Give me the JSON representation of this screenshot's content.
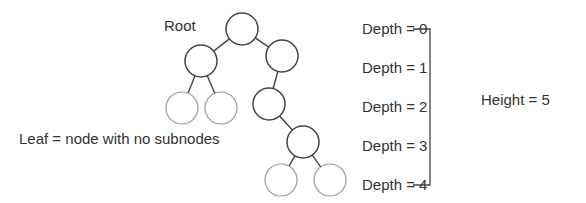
{
  "labels": {
    "root": "Root",
    "leaf": "Leaf = node with no subnodes",
    "height": "Height = 5"
  },
  "depths": [
    {
      "label": "Depth = 0",
      "y": 20
    },
    {
      "label": "Depth = 1",
      "y": 59
    },
    {
      "label": "Depth = 2",
      "y": 98
    },
    {
      "label": "Depth = 3",
      "y": 137
    },
    {
      "label": "Depth = 4",
      "y": 176
    }
  ],
  "tree": {
    "nodes": [
      {
        "id": "root",
        "cx": 242,
        "cy": 29,
        "leaf": false
      },
      {
        "id": "n1",
        "cx": 201,
        "cy": 61,
        "leaf": false
      },
      {
        "id": "n2",
        "cx": 282,
        "cy": 56,
        "leaf": false
      },
      {
        "id": "n3",
        "cx": 182,
        "cy": 108,
        "leaf": true
      },
      {
        "id": "n4",
        "cx": 221,
        "cy": 108,
        "leaf": true
      },
      {
        "id": "n5",
        "cx": 269,
        "cy": 104,
        "leaf": false
      },
      {
        "id": "n6",
        "cx": 303,
        "cy": 142,
        "leaf": false
      },
      {
        "id": "n7",
        "cx": 281,
        "cy": 180,
        "leaf": true
      },
      {
        "id": "n8",
        "cx": 330,
        "cy": 180,
        "leaf": true
      }
    ],
    "edges": [
      [
        "root",
        "n1"
      ],
      [
        "root",
        "n2"
      ],
      [
        "n1",
        "n3"
      ],
      [
        "n1",
        "n4"
      ],
      [
        "n2",
        "n5"
      ],
      [
        "n5",
        "n6"
      ],
      [
        "n6",
        "n7"
      ],
      [
        "n6",
        "n8"
      ]
    ]
  },
  "colors": {
    "internal": "#444444",
    "leaf": "#999999",
    "text": "#333333"
  }
}
